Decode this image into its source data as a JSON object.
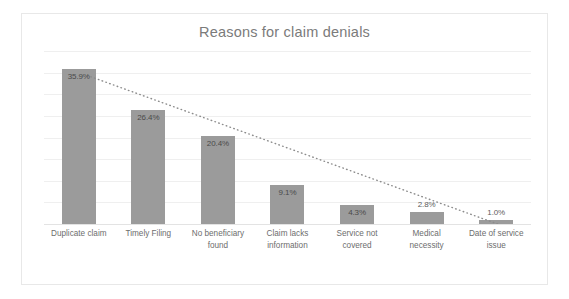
{
  "chart_data": {
    "type": "bar",
    "title": "Reasons for claim denials",
    "xlabel": "",
    "ylabel": "",
    "ylim": [
      0,
      40
    ],
    "grid": true,
    "legend": "none",
    "gridline_values": [
      40,
      35,
      30,
      25,
      20,
      15,
      10,
      5,
      0
    ],
    "categories": [
      "Duplicate claim",
      "Timely Filing",
      "No beneficiary found",
      "Claim lacks information",
      "Service not covered",
      "Medical necessity",
      "Date of service issue"
    ],
    "category_lines": [
      [
        "Duplicate claim"
      ],
      [
        "Timely Filing"
      ],
      [
        "No beneficiary",
        "found"
      ],
      [
        "Claim lacks",
        "information"
      ],
      [
        "Service not",
        "covered"
      ],
      [
        "Medical",
        "necessity"
      ],
      [
        "Date of service",
        "issue"
      ]
    ],
    "values": [
      35.9,
      26.4,
      20.4,
      9.1,
      4.3,
      2.8,
      1.0
    ],
    "data_labels": [
      "35.9%",
      "26.4%",
      "20.4%",
      "9.1%",
      "4.3%",
      "2.8%",
      "1.0%"
    ],
    "series": [
      {
        "name": "Percent of denials",
        "values": [
          35.9,
          26.4,
          20.4,
          9.1,
          4.3,
          2.8,
          1.0
        ],
        "color": "#9b9b9b"
      }
    ],
    "trendline": {
      "style": "dotted",
      "color": "#8c8c8c",
      "from_value": 35.9,
      "to_value": 1.0
    },
    "colors": {
      "bar": "#9b9b9b",
      "title": "#7b7b7b",
      "gridline": "#efefef",
      "axis_text": "#6d6d6d",
      "data_label": "#4a4a4a",
      "frame": "#e8e8e8",
      "background": "#ffffff"
    }
  }
}
